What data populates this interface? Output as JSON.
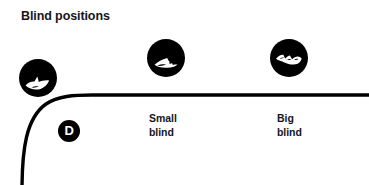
{
  "figure": {
    "title": "Blind positions",
    "background_color": "#ffffff",
    "ink_color": "#000000",
    "text_color": "#15161a"
  },
  "table_edge": {
    "name": "poker-table-edge",
    "stroke_color": "#000000",
    "stroke_width": 3
  },
  "dealer_button": {
    "label": "D",
    "name": "dealer-button",
    "fill_color": "#000000",
    "label_color": "#ffffff"
  },
  "seats": [
    {
      "id": "dealer",
      "chip_icon": "poker-chip-icon",
      "caption": ""
    },
    {
      "id": "small-blind",
      "chip_icon": "poker-chip-icon",
      "caption": "Small\nblind"
    },
    {
      "id": "big-blind",
      "chip_icon": "poker-chip-icon",
      "caption": "Big\nblind"
    }
  ]
}
